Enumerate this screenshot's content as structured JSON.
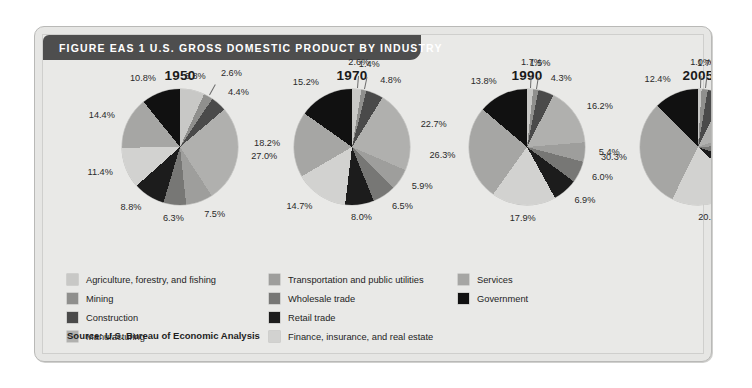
{
  "figure": {
    "title": "FIGURE EAS 1  U.S. GROSS DOMESTIC PRODUCT BY INDUSTRY",
    "source": "Source: U.S. Bureau of Economic Analysis"
  },
  "colors": {
    "header_bar": "#4e4e4e",
    "card_background": "#e9e9e7",
    "page_background": "#ffffff",
    "series": [
      "#c8c8c6",
      "#8f8f8d",
      "#4a4a4a",
      "#b0b0ae",
      "#9e9e9c",
      "#777775",
      "#1c1c1c",
      "#d2d2d0",
      "#a6a6a4",
      "#111111"
    ]
  },
  "legend": {
    "columns": [
      [
        {
          "label": "Agriculture, forestry, and fishing",
          "color": "#c8c8c6"
        },
        {
          "label": "Mining",
          "color": "#8f8f8d"
        },
        {
          "label": "Construction",
          "color": "#4a4a4a"
        },
        {
          "label": "Manufacturing",
          "color": "#b0b0ae"
        }
      ],
      [
        {
          "label": "Transportation and public utilities",
          "color": "#9e9e9c"
        },
        {
          "label": "Wholesale trade",
          "color": "#777775"
        },
        {
          "label": "Retail trade",
          "color": "#1c1c1c"
        },
        {
          "label": "Finance, insurance, and real estate",
          "color": "#d2d2d0"
        }
      ],
      [
        {
          "label": "Services",
          "color": "#a6a6a4"
        },
        {
          "label": "Government",
          "color": "#111111"
        }
      ]
    ]
  },
  "chart_data": {
    "type": "pie",
    "title": "U.S. GROSS DOMESTIC PRODUCT BY INDUSTRY",
    "categories": [
      "Agriculture, forestry, and fishing",
      "Mining",
      "Construction",
      "Manufacturing",
      "Transportation and public utilities",
      "Wholesale trade",
      "Retail trade",
      "Finance, insurance, and real estate",
      "Services",
      "Government"
    ],
    "unit": "percent of GDP",
    "legend_position": "bottom",
    "charts": [
      {
        "title": "1950",
        "values": [
          6.8,
          2.6,
          4.4,
          27.0,
          7.5,
          6.3,
          8.8,
          11.4,
          14.4,
          10.8
        ],
        "labels": [
          "6.8%",
          "2.6%",
          "4.4%",
          "27.0%",
          "7.5%",
          "6.3%",
          "8.8%",
          "11.4%",
          "14.4%",
          "10.8%"
        ]
      },
      {
        "title": "1970",
        "values": [
          2.6,
          1.4,
          4.8,
          22.7,
          5.9,
          6.5,
          8.0,
          14.7,
          18.2,
          15.2
        ],
        "labels": [
          "2.6%",
          "1.4%",
          "4.8%",
          "22.7%",
          "5.9%",
          "6.5%",
          "8.0%",
          "14.7%",
          "18.2%",
          "15.2%"
        ]
      },
      {
        "title": "1990",
        "values": [
          1.7,
          1.5,
          4.3,
          16.2,
          5.4,
          6.0,
          6.9,
          17.9,
          26.3,
          13.8
        ],
        "labels": [
          "1.7%",
          "1.5%",
          "4.3%",
          "16.2%",
          "5.4%",
          "6.0%",
          "6.9%",
          "17.9%",
          "26.3%",
          "13.8%"
        ]
      },
      {
        "title": "2005",
        "values": [
          1.0,
          1.7,
          4.8,
          12.0,
          4.8,
          5.9,
          6.6,
          20.5,
          30.3,
          12.4
        ],
        "labels": [
          "1.0%",
          "1.7%",
          "4.8%",
          "12.0%",
          "4.8%",
          "5.9%",
          "6.6%",
          "20.5%",
          "30.3%",
          "12.4%"
        ]
      }
    ]
  }
}
